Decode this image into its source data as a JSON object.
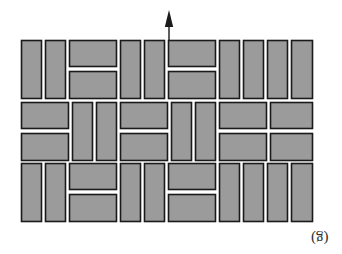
{
  "figure": {
    "kind": "paving-pattern-diagram",
    "caption": "(g)",
    "caption_orientation_deg": 180,
    "background_color": "#ffffff",
    "tile_fill_color": "#9b9b9b",
    "tile_stroke_color": "#1a1a1a",
    "joint_color": "#ffffff",
    "arrow": {
      "name": "direction-arrow",
      "label": "",
      "points": "up",
      "color": "#1a1a1a",
      "x": 169,
      "y_top": 10,
      "y_bottom": 40
    },
    "grid": {
      "x_left": 21,
      "x_right": 313,
      "y_top": 40,
      "y_bottom": 222,
      "bands": 3,
      "band_height": 60.7,
      "unit_width": 48.7,
      "tile_long": 44,
      "tile_short": 20
    },
    "tiles": [
      {
        "id": "t01",
        "x": 21,
        "y": 40,
        "w": 21,
        "h": 59,
        "orient": "vertical"
      },
      {
        "id": "t02",
        "x": 45,
        "y": 40,
        "w": 21,
        "h": 59,
        "orient": "vertical"
      },
      {
        "id": "t03",
        "x": 69,
        "y": 40,
        "w": 48,
        "h": 27,
        "orient": "horizontal"
      },
      {
        "id": "t04",
        "x": 69,
        "y": 71,
        "w": 48,
        "h": 28,
        "orient": "horizontal"
      },
      {
        "id": "t05",
        "x": 120,
        "y": 40,
        "w": 21,
        "h": 59,
        "orient": "vertical"
      },
      {
        "id": "t06",
        "x": 144,
        "y": 40,
        "w": 21,
        "h": 59,
        "orient": "vertical"
      },
      {
        "id": "t07",
        "x": 168,
        "y": 40,
        "w": 48,
        "h": 27,
        "orient": "horizontal"
      },
      {
        "id": "t08",
        "x": 168,
        "y": 71,
        "w": 48,
        "h": 28,
        "orient": "horizontal"
      },
      {
        "id": "t09",
        "x": 219,
        "y": 40,
        "w": 21,
        "h": 59,
        "orient": "vertical"
      },
      {
        "id": "t10",
        "x": 243,
        "y": 40,
        "w": 21,
        "h": 59,
        "orient": "vertical"
      },
      {
        "id": "t11",
        "x": 267,
        "y": 40,
        "w": 21,
        "h": 59,
        "orient": "vertical"
      },
      {
        "id": "t12",
        "x": 291,
        "y": 40,
        "w": 22,
        "h": 59,
        "orient": "vertical"
      },
      {
        "id": "t13",
        "x": 21,
        "y": 102,
        "w": 48,
        "h": 27,
        "orient": "horizontal"
      },
      {
        "id": "t14",
        "x": 21,
        "y": 133,
        "w": 48,
        "h": 28,
        "orient": "horizontal"
      },
      {
        "id": "t15",
        "x": 72,
        "y": 102,
        "w": 21,
        "h": 59,
        "orient": "vertical"
      },
      {
        "id": "t16",
        "x": 96,
        "y": 102,
        "w": 21,
        "h": 59,
        "orient": "vertical"
      },
      {
        "id": "t17",
        "x": 120,
        "y": 102,
        "w": 48,
        "h": 27,
        "orient": "horizontal"
      },
      {
        "id": "t18",
        "x": 120,
        "y": 133,
        "w": 48,
        "h": 28,
        "orient": "horizontal"
      },
      {
        "id": "t19",
        "x": 171,
        "y": 102,
        "w": 21,
        "h": 59,
        "orient": "vertical"
      },
      {
        "id": "t20",
        "x": 195,
        "y": 102,
        "w": 21,
        "h": 59,
        "orient": "vertical"
      },
      {
        "id": "t21",
        "x": 219,
        "y": 102,
        "w": 48,
        "h": 27,
        "orient": "horizontal"
      },
      {
        "id": "t22",
        "x": 219,
        "y": 133,
        "w": 48,
        "h": 28,
        "orient": "horizontal"
      },
      {
        "id": "t23",
        "x": 270,
        "y": 102,
        "w": 43,
        "h": 27,
        "orient": "horizontal"
      },
      {
        "id": "t24",
        "x": 270,
        "y": 133,
        "w": 43,
        "h": 28,
        "orient": "horizontal"
      },
      {
        "id": "t25",
        "x": 21,
        "y": 163,
        "w": 21,
        "h": 59,
        "orient": "vertical"
      },
      {
        "id": "t26",
        "x": 45,
        "y": 163,
        "w": 21,
        "h": 59,
        "orient": "vertical"
      },
      {
        "id": "t27",
        "x": 69,
        "y": 163,
        "w": 48,
        "h": 27,
        "orient": "horizontal"
      },
      {
        "id": "t28",
        "x": 69,
        "y": 194,
        "w": 48,
        "h": 28,
        "orient": "horizontal"
      },
      {
        "id": "t29",
        "x": 120,
        "y": 163,
        "w": 21,
        "h": 59,
        "orient": "vertical"
      },
      {
        "id": "t30",
        "x": 144,
        "y": 163,
        "w": 21,
        "h": 59,
        "orient": "vertical"
      },
      {
        "id": "t31",
        "x": 168,
        "y": 163,
        "w": 48,
        "h": 27,
        "orient": "horizontal"
      },
      {
        "id": "t32",
        "x": 168,
        "y": 194,
        "w": 48,
        "h": 28,
        "orient": "horizontal"
      },
      {
        "id": "t33",
        "x": 219,
        "y": 163,
        "w": 21,
        "h": 59,
        "orient": "vertical"
      },
      {
        "id": "t34",
        "x": 243,
        "y": 163,
        "w": 21,
        "h": 59,
        "orient": "vertical"
      },
      {
        "id": "t35",
        "x": 267,
        "y": 163,
        "w": 21,
        "h": 59,
        "orient": "vertical"
      },
      {
        "id": "t36",
        "x": 291,
        "y": 163,
        "w": 22,
        "h": 59,
        "orient": "vertical"
      }
    ]
  }
}
